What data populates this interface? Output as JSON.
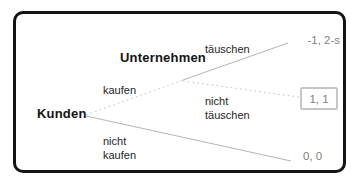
{
  "diagram": {
    "type": "game-tree",
    "root_player": "Kunden",
    "second_player": "Unternehmen",
    "branches": {
      "kaufen": {
        "label": "kaufen",
        "style": "dotted",
        "from": "Kunden"
      },
      "nicht_kaufen": {
        "line1": "nicht",
        "line2": "kaufen",
        "style": "solid",
        "from": "Kunden"
      },
      "taeuschen": {
        "label": "täuschen",
        "style": "solid",
        "from": "Unternehmen"
      },
      "nicht_taeuschen": {
        "line1": "nicht",
        "line2": "täuschen",
        "style": "dotted",
        "from": "Unternehmen"
      }
    },
    "payoffs": {
      "taeuschen": "-1, 2-s",
      "nicht_taeuschen": "1, 1",
      "nicht_kaufen": "0, 0",
      "boxed_outcome": "nicht_taeuschen"
    },
    "colors": {
      "frame_border": "#141414",
      "player_text": "#141414",
      "branch_text": "#262626",
      "payoff_text": "#7f7f7f",
      "line_solid": "#b5b5b5",
      "line_dotted": "#c9c9c9",
      "payoff_box_border": "#c6c6c6",
      "background": "#ffffff"
    }
  }
}
